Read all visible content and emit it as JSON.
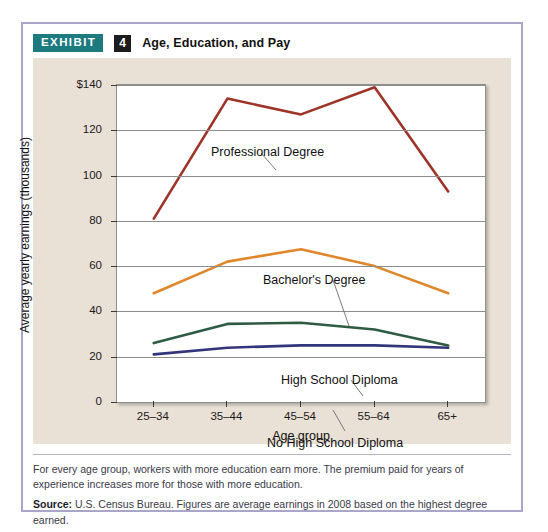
{
  "exhibit": {
    "badge_label": "EXHIBIT",
    "number": "4",
    "title": "Age, Education, and Pay"
  },
  "caption": {
    "body": "For every age group, workers with more education earn more. The premium paid for years of experience increases more for those with more education.",
    "source_label": "Source:",
    "source_body": "U.S. Census Bureau. Figures are average earnings in 2008 based on the highest degree earned."
  },
  "chart_data": {
    "type": "line",
    "title": "Age, Education, and Pay",
    "xlabel": "Age group",
    "ylabel": "Average yearly earnings (thousands)",
    "categories": [
      "25–34",
      "35–44",
      "45–54",
      "55–64",
      "65+"
    ],
    "ylim": [
      0,
      140
    ],
    "yticks": [
      0,
      20,
      40,
      60,
      80,
      100,
      120,
      140
    ],
    "ytick_labels": [
      "0",
      "20",
      "40",
      "60",
      "80",
      "100",
      "120",
      "$140"
    ],
    "grid": true,
    "legend": "inline-annotations",
    "series": [
      {
        "name": "Professional Degree",
        "color": "#9e3328",
        "values": [
          81,
          134,
          127,
          139,
          93
        ],
        "label_x": 178,
        "label_y": 87,
        "leader": "M228,95 L243,112"
      },
      {
        "name": "Bachelor's Degree",
        "color": "#e0872c",
        "values": [
          48,
          62,
          67.5,
          60,
          48
        ],
        "label_x": 230,
        "label_y": 215,
        "leader": "M300,222 L316,268"
      },
      {
        "name": "High School Diploma",
        "color": "#2f5b43",
        "values": [
          26,
          34.5,
          35,
          32,
          25
        ],
        "label_x": 248,
        "label_y": 315,
        "leader": "M318,322 L330,338"
      },
      {
        "name": "No High School Diploma",
        "color": "#33357a",
        "values": [
          21,
          24,
          25,
          25,
          24
        ],
        "label_x": 234,
        "label_y": 378,
        "leader": "M312,373 L300,352"
      }
    ]
  }
}
